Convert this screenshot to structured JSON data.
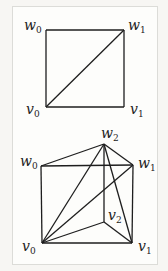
{
  "figure_top": {
    "title": "square-triangulation",
    "vertices": [
      {
        "id": "w0",
        "label": "w",
        "sub": "0",
        "x": 46,
        "y": 30,
        "lx": 24,
        "ly": 30
      },
      {
        "id": "w1",
        "label": "w",
        "sub": "1",
        "x": 124,
        "y": 30,
        "lx": 128,
        "ly": 30
      },
      {
        "id": "v0",
        "label": "v",
        "sub": "0",
        "x": 46,
        "y": 107,
        "lx": 26,
        "ly": 114
      },
      {
        "id": "v1",
        "label": "v",
        "sub": "1",
        "x": 124,
        "y": 107,
        "lx": 130,
        "ly": 114
      }
    ],
    "edges": [
      [
        "w0",
        "w1"
      ],
      [
        "w1",
        "v1"
      ],
      [
        "v1",
        "v0"
      ],
      [
        "v0",
        "w0"
      ],
      [
        "v0",
        "w1"
      ]
    ]
  },
  "figure_bottom": {
    "title": "prism-triangulation",
    "vertices": [
      {
        "id": "w0",
        "label": "w",
        "sub": "0",
        "x": 41,
        "y": 166,
        "lx": 20,
        "ly": 166
      },
      {
        "id": "w1",
        "label": "w",
        "sub": "1",
        "x": 133,
        "y": 165,
        "lx": 138,
        "ly": 168
      },
      {
        "id": "w2",
        "label": "w",
        "sub": "2",
        "x": 104,
        "y": 144,
        "lx": 101,
        "ly": 138
      },
      {
        "id": "v0",
        "label": "v",
        "sub": "0",
        "x": 42,
        "y": 243,
        "lx": 22,
        "ly": 251
      },
      {
        "id": "v1",
        "label": "v",
        "sub": "1",
        "x": 132,
        "y": 243,
        "lx": 138,
        "ly": 251
      },
      {
        "id": "v2",
        "label": "v",
        "sub": "2",
        "x": 104,
        "y": 222,
        "lx": 108,
        "ly": 220
      }
    ],
    "edges": [
      [
        "w0",
        "w1"
      ],
      [
        "w0",
        "w2"
      ],
      [
        "w2",
        "w1"
      ],
      [
        "w0",
        "v0"
      ],
      [
        "w1",
        "v1"
      ],
      [
        "w2",
        "v2"
      ],
      [
        "v0",
        "v1"
      ],
      [
        "v0",
        "v2"
      ],
      [
        "v2",
        "v1"
      ],
      [
        "v0",
        "w1"
      ],
      [
        "v0",
        "w2"
      ],
      [
        "w2",
        "v1"
      ]
    ]
  },
  "colors": {
    "line": "#1e1e1e",
    "frame": "#dcdcd8",
    "background": "#fdfdfb"
  }
}
